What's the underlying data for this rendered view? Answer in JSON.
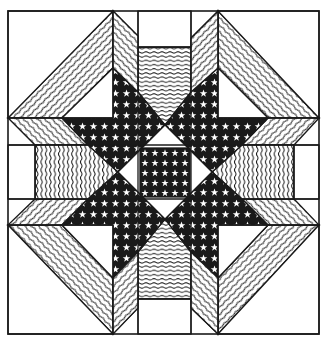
{
  "figure": {
    "title": "Eight-pointed star quilt block"
  },
  "colors": {
    "ink": "#1a1a1a",
    "paper": "#ffffff"
  },
  "fabrics": {
    "star_print": "dark fabric with white five-point stars",
    "diagonal_wavy": "fine diagonal wavy stripes",
    "horizontal_wavy": "fine horizontal wavy stripes",
    "vertical_wavy": "fine vertical wavy stripes",
    "plain": "white"
  },
  "geometry": {
    "border": [
      8,
      11,
      319,
      334
    ],
    "center_square": [
      140,
      148,
      190,
      197
    ],
    "center_diamond": [
      [
        165,
        125
      ],
      [
        212,
        172
      ],
      [
        165,
        219
      ],
      [
        118,
        172
      ]
    ]
  }
}
